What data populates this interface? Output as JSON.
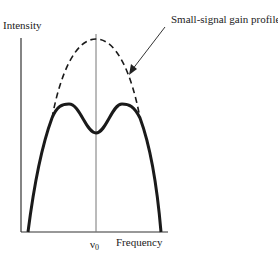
{
  "diagram": {
    "y_axis_label": "Intensity",
    "x_axis_label": "Frequency",
    "center_frequency_label": "ν",
    "center_frequency_subscript": "0",
    "annotation": "Small-signal gain profile",
    "curves": [
      {
        "name": "small-signal-gain-profile",
        "style": "dashed",
        "description": "Parabolic gain profile centered at ν0"
      },
      {
        "name": "saturated-gain-profile",
        "style": "solid",
        "description": "Gain profile with spectral hole burned at ν0, showing two peaks and a central dip"
      }
    ],
    "colors": {
      "line": "#1a1a1a",
      "axis": "#333333",
      "center_line": "#777777"
    }
  }
}
